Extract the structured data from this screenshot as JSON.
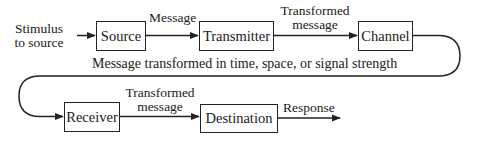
{
  "diagram": {
    "type": "communication-flow",
    "input_label": "Stimulus to source",
    "input_label_lines": [
      "Stimulus",
      "to source"
    ],
    "nodes": [
      {
        "id": "source",
        "label": "Source"
      },
      {
        "id": "transmitter",
        "label": "Transmitter"
      },
      {
        "id": "channel",
        "label": "Channel"
      },
      {
        "id": "receiver",
        "label": "Receiver"
      },
      {
        "id": "destination",
        "label": "Destination"
      }
    ],
    "edges": [
      {
        "from": "stimulus",
        "to": "source",
        "label": ""
      },
      {
        "from": "source",
        "to": "transmitter",
        "label": "Message"
      },
      {
        "from": "transmitter",
        "to": "channel",
        "label_lines": [
          "Transformed",
          "message"
        ]
      },
      {
        "from": "channel",
        "to": "receiver",
        "label": "Message transformed in time, space, or signal strength"
      },
      {
        "from": "receiver",
        "to": "destination",
        "label_lines": [
          "Transformed",
          "message"
        ]
      },
      {
        "from": "destination",
        "to": "output",
        "label": "Response"
      }
    ],
    "colors": {
      "line": "#222222",
      "background": "#ffffff",
      "text": "#1a1a1a"
    }
  }
}
